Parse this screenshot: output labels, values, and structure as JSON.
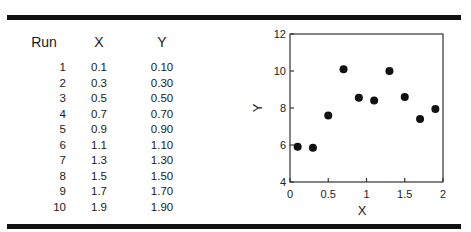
{
  "table": {
    "headers": [
      "Run",
      "X",
      "Y"
    ],
    "rows": [
      [
        "1",
        "0.1",
        "0.10"
      ],
      [
        "2",
        "0.3",
        "0.30"
      ],
      [
        "3",
        "0.5",
        "0.50"
      ],
      [
        "4",
        "0.7",
        "0.70"
      ],
      [
        "5",
        "0.9",
        "0.90"
      ],
      [
        "6",
        "1.1",
        "1.10"
      ],
      [
        "7",
        "1.3",
        "1.30"
      ],
      [
        "8",
        "1.5",
        "1.50"
      ],
      [
        "9",
        "1.7",
        "1.70"
      ],
      [
        "10",
        "1.9",
        "1.90"
      ]
    ]
  },
  "chart_data": {
    "type": "scatter",
    "title": "",
    "xlabel": "X",
    "ylabel": "Y",
    "xlim": [
      0,
      2
    ],
    "ylim": [
      4,
      12
    ],
    "xticks": [
      "0",
      "0.5",
      "1",
      "1.5",
      "2"
    ],
    "yticks": [
      "4",
      "6",
      "8",
      "10",
      "12"
    ],
    "grid": false,
    "legend": null,
    "x": [
      0.1,
      0.3,
      0.5,
      0.7,
      0.9,
      1.1,
      1.3,
      1.5,
      1.7,
      1.9
    ],
    "y": [
      5.9,
      5.85,
      7.6,
      10.1,
      8.55,
      8.4,
      10.0,
      8.6,
      7.4,
      7.95
    ],
    "marker_color": "#111111"
  }
}
